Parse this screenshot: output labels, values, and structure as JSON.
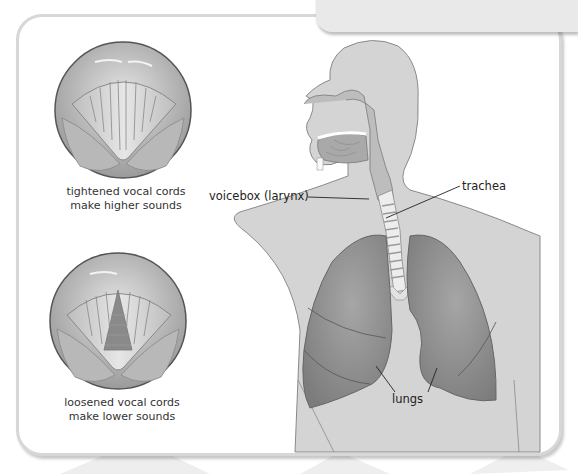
{
  "diagram": {
    "title_fragment": "...",
    "vocal_cords": [
      {
        "caption_line1": "tightened vocal cords",
        "caption_line2": "make higher sounds"
      },
      {
        "caption_line1": "loosened vocal cords",
        "caption_line2": "make lower sounds"
      }
    ],
    "labels": {
      "voicebox": "voicebox (larynx)",
      "trachea": "trachea",
      "lungs": "lungs"
    },
    "colors": {
      "body": "#d4d4d4",
      "lungs": "#8d8d8d",
      "airway": "#ededed",
      "outline": "#7a7a7a",
      "panel_border": "#d7d7d7"
    }
  }
}
